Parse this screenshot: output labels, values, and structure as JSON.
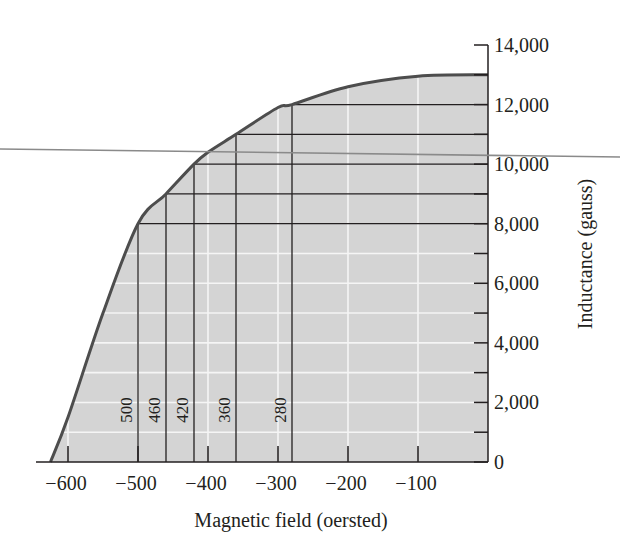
{
  "chart_data": {
    "type": "area",
    "title": "",
    "xlabel": "Magnetic field (oersted)",
    "ylabel": "Inductance (gauss)",
    "xlim": [
      -640,
      0
    ],
    "ylim": [
      0,
      14000
    ],
    "x_ticks": [
      -600,
      -500,
      -400,
      -300,
      -200,
      -100
    ],
    "x_tick_labels": [
      "−600",
      "−500",
      "−400",
      "−300",
      "−200",
      "−100"
    ],
    "y_ticks": [
      0,
      1000,
      2000,
      3000,
      4000,
      5000,
      6000,
      7000,
      8000,
      9000,
      10000,
      11000,
      12000,
      13000,
      14000
    ],
    "y_tick_labels": [
      "0",
      "2,000",
      "4,000",
      "6,000",
      "8,000",
      "10,000",
      "12,000",
      "14,000"
    ],
    "y_tick_label_values": [
      0,
      2000,
      4000,
      6000,
      8000,
      10000,
      12000,
      14000
    ],
    "y_axis_position": "right",
    "grid": "white minor gridlines inside shaded region",
    "curve": {
      "name": "B-H curve",
      "x": [
        -625,
        -600,
        -550,
        -500,
        -460,
        -420,
        -400,
        -360,
        -300,
        -280,
        -200,
        -100,
        0
      ],
      "y": [
        0,
        1500,
        5000,
        8000,
        9000,
        10000,
        10400,
        11000,
        11900,
        12000,
        12600,
        12950,
        13000
      ]
    },
    "reference_lines": [
      {
        "label": "500",
        "x": -500,
        "y": 8000
      },
      {
        "label": "460",
        "x": -460,
        "y": 9000
      },
      {
        "label": "420",
        "x": -420,
        "y": 10000
      },
      {
        "label": "360",
        "x": -360,
        "y": 11000
      },
      {
        "label": "280",
        "x": -280,
        "y": 12000
      }
    ],
    "annotations": [
      "500",
      "460",
      "420",
      "360",
      "280"
    ],
    "legend": null
  },
  "colors": {
    "fill": "#d4d4d4",
    "curve": "#4d4d4d",
    "lines": "#231f20",
    "grid": "#f5f5f5",
    "stray_line": "#8a8a8a"
  }
}
